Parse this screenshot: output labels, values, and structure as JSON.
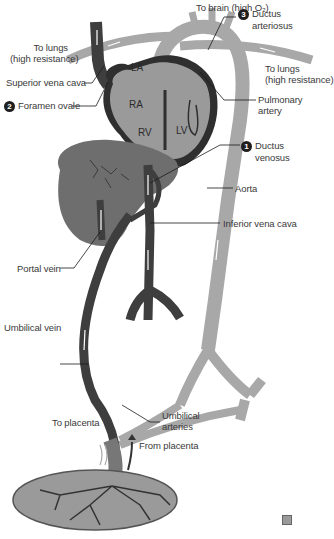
{
  "colors": {
    "vein_dark": "#3e3e3e",
    "artery_light": "#a8a8a8",
    "heart_fill": "#8c8c8c",
    "heart_wall": "#2f2f2f",
    "liver": "#6e6e6e",
    "placenta": "#9a9a9a",
    "flow_arrow": "#ffffff",
    "leader_line": "#1a1a1a"
  },
  "labels": {
    "to_brain": "To brain (high O₂)",
    "to_lungs_left_1": "To lungs",
    "to_lungs_left_2": "(high resistance)",
    "to_lungs_right_1": "To lungs",
    "to_lungs_right_2": "(high resistance)",
    "superior_vena_cava": "Superior vena cava",
    "foramen_ovale_num": "2",
    "foramen_ovale": "Foramen ovale",
    "ductus_arteriosus_num": "3",
    "ductus_arteriosus_1": "Ductus",
    "ductus_arteriosus_2": "arteriosus",
    "pulmonary_artery_1": "Pulmonary",
    "pulmonary_artery_2": "artery",
    "ductus_venosus_num": "1",
    "ductus_venosus_1": "Ductus",
    "ductus_venosus_2": "venosus",
    "aorta": "Aorta",
    "inferior_vena_cava": "Inferior vena cava",
    "portal_vein": "Portal vein",
    "umbilical_vein": "Umbilical vein",
    "umbilical_arteries_1": "Umbilical",
    "umbilical_arteries_2": "arteries",
    "to_placenta": "To placenta",
    "from_placenta": "From placenta"
  },
  "chambers": {
    "la": "LA",
    "ra": "RA",
    "rv": "RV",
    "lv": "LV"
  }
}
